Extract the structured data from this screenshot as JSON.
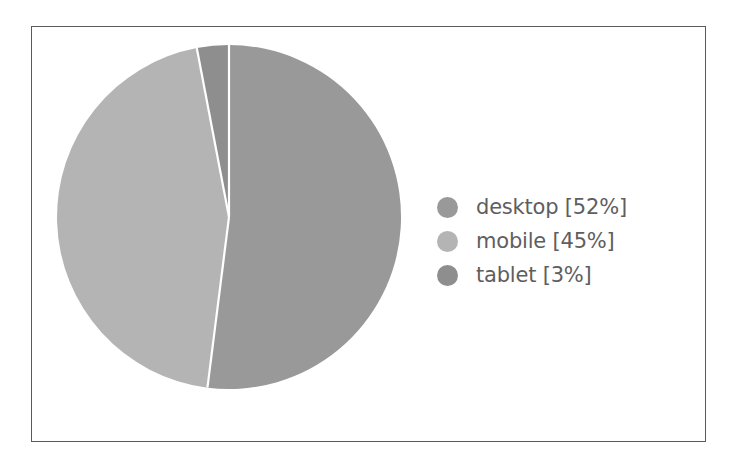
{
  "figure": {
    "background_color": "#ffffff",
    "frame_border_color": "#5a5a5a",
    "divider_color": "#ffffff"
  },
  "legend": {
    "position": "right",
    "entries": [
      {
        "label": "desktop [52%]",
        "name": "desktop",
        "value": 52,
        "color": "#999999"
      },
      {
        "label": "mobile [45%]",
        "name": "mobile",
        "value": 45,
        "color": "#b4b4b4"
      },
      {
        "label": "tablet [3%]",
        "name": "tablet",
        "value": 3,
        "color": "#8e8e8e"
      }
    ]
  },
  "chart_data": {
    "type": "pie",
    "title": "",
    "labels": [
      "desktop",
      "mobile",
      "tablet"
    ],
    "values": [
      52,
      45,
      3
    ],
    "display_labels": [
      "desktop [52%]",
      "mobile [45%]",
      "tablet [3%]"
    ],
    "colors": [
      "#999999",
      "#b4b4b4",
      "#8e8e8e"
    ],
    "units": "percent",
    "total": 100,
    "start_angle_deg": 90,
    "direction": "clockwise",
    "legend_position": "right",
    "grid": false,
    "xlabel": "",
    "ylabel": ""
  }
}
